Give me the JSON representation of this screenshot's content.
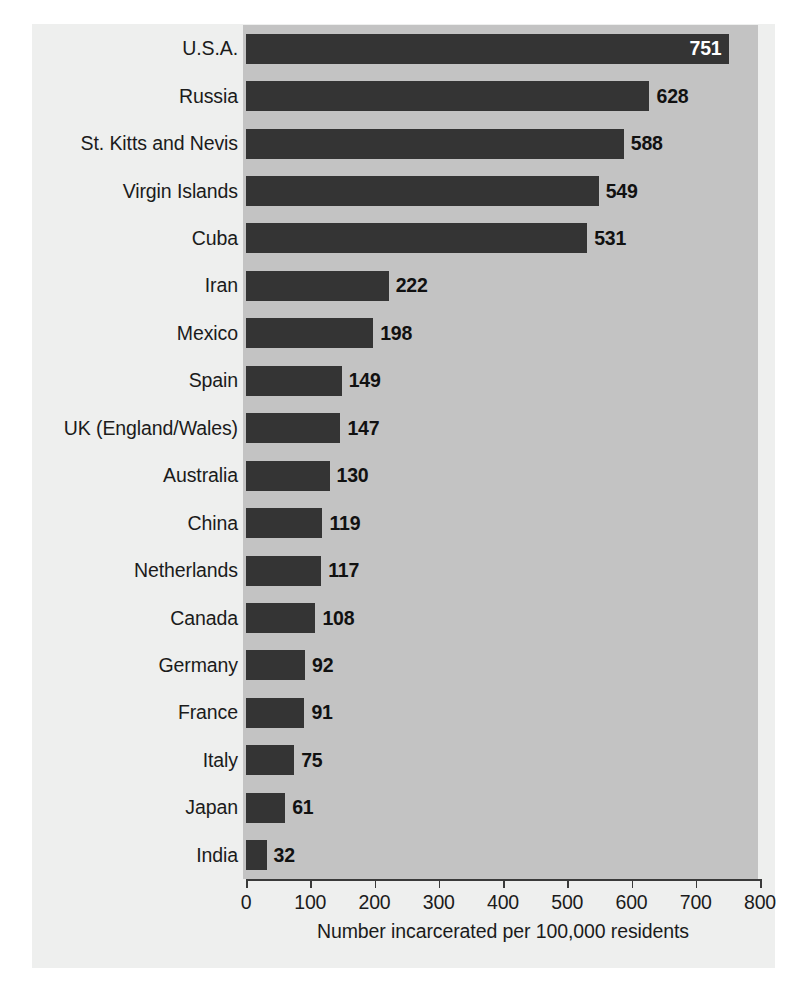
{
  "chart_data": {
    "type": "bar",
    "orientation": "horizontal",
    "title": "",
    "xlabel": "Number incarcerated per 100,000 residents",
    "ylabel": "",
    "xlim": [
      0,
      800
    ],
    "xticks": [
      0,
      100,
      200,
      300,
      400,
      500,
      600,
      700,
      800
    ],
    "xtick_labels": [
      "0",
      "100",
      "200",
      "300",
      "400",
      "500",
      "600",
      "700",
      "800"
    ],
    "grid": false,
    "legend": null,
    "categories": [
      "U.S.A.",
      "Russia",
      "St. Kitts and Nevis",
      "Virgin Islands",
      "Cuba",
      "Iran",
      "Mexico",
      "Spain",
      "UK (England/Wales)",
      "Australia",
      "China",
      "Netherlands",
      "Canada",
      "Germany",
      "France",
      "Italy",
      "Japan",
      "India"
    ],
    "values": [
      751,
      628,
      588,
      549,
      531,
      222,
      198,
      149,
      147,
      130,
      119,
      117,
      108,
      92,
      91,
      75,
      61,
      32
    ],
    "value_labels": [
      "751",
      "628",
      "588",
      "549",
      "531",
      "222",
      "198",
      "149",
      "147",
      "130",
      "119",
      "117",
      "108",
      "92",
      "91",
      "75",
      "61",
      "32"
    ],
    "label_placement": [
      "inside",
      "outside",
      "outside",
      "outside",
      "outside",
      "outside",
      "outside",
      "outside",
      "outside",
      "outside",
      "outside",
      "outside",
      "outside",
      "outside",
      "outside",
      "outside",
      "outside",
      "outside"
    ],
    "colors": {
      "bar": "#343434",
      "plot_band": "#c3c3c3",
      "panel_background": "#eeefee",
      "page_background": "#ffffff",
      "text": "#1b1b1b",
      "inside_label": "#ffffff",
      "axis": "#3a3a3a"
    }
  }
}
